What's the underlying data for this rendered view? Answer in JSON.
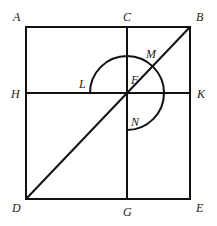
{
  "diagram": {
    "points": {
      "A": {
        "label": "A",
        "x": 26,
        "y": 27
      },
      "B": {
        "label": "B",
        "x": 190,
        "y": 27
      },
      "C": {
        "label": "C",
        "x": 127,
        "y": 27
      },
      "D": {
        "label": "D",
        "x": 26,
        "y": 199
      },
      "E": {
        "label": "E",
        "x": 190,
        "y": 199
      },
      "G": {
        "label": "G",
        "x": 127,
        "y": 199
      },
      "H": {
        "label": "H",
        "x": 26,
        "y": 93
      },
      "K": {
        "label": "K",
        "x": 190,
        "y": 93
      },
      "F": {
        "label": "F",
        "x": 127,
        "y": 93
      },
      "L": {
        "label": "L",
        "x": 90,
        "y": 93
      },
      "M": {
        "label": "M",
        "x": 153,
        "y": 67
      },
      "N": {
        "label": "N",
        "x": 127,
        "y": 130
      }
    },
    "labels": {
      "A": "A",
      "B": "B",
      "C": "C",
      "D": "D",
      "E": "E",
      "F": "F",
      "G": "G",
      "H": "H",
      "K": "K",
      "L": "L",
      "M": "M",
      "N": "N"
    },
    "arc": {
      "center": "F",
      "radius": 37,
      "from": "L",
      "to": "N",
      "sweep": "clockwise 270°"
    }
  }
}
